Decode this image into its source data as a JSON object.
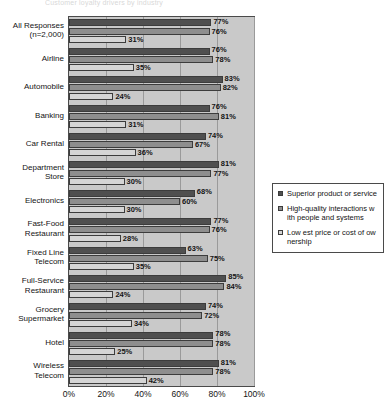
{
  "title_strip": "Customer loyalty drivers by industry",
  "chart_data": {
    "type": "bar",
    "orientation": "horizontal",
    "title": "",
    "xlabel": "",
    "ylabel": "",
    "xlim": [
      0,
      100
    ],
    "xticks": [
      "0%",
      "20%",
      "40%",
      "60%",
      "80%",
      "100%"
    ],
    "xtick_values": [
      0,
      20,
      40,
      60,
      80,
      100
    ],
    "grid": true,
    "legend_position": "right",
    "categories": [
      "All Responses\n(n=2,000)",
      "Airline",
      "Automobile",
      "Banking",
      "Car Rental",
      "Department\nStore",
      "Electronics",
      "Fast-Food\nRestaurant",
      "Fixed Line\nTelecom",
      "Full-Service\nRestaurant",
      "Grocery\nSupermarket",
      "Hotel",
      "Wireless\nTelecom"
    ],
    "series": [
      {
        "name": "Superior product or service",
        "color": "#4f4f4f",
        "values": [
          77,
          76,
          83,
          76,
          74,
          81,
          68,
          77,
          63,
          85,
          74,
          78,
          81
        ],
        "labels": [
          "77%",
          "76%",
          "83%",
          "76%",
          "74%",
          "81%",
          "68%",
          "77%",
          "63%",
          "85%",
          "74%",
          "78%",
          "81%"
        ]
      },
      {
        "name": "High-quality interactions with people and systems",
        "color": "#8e8e8e",
        "values": [
          76,
          78,
          82,
          81,
          67,
          77,
          60,
          76,
          75,
          84,
          72,
          78,
          78
        ],
        "labels": [
          "76%",
          "78%",
          "82%",
          "81%",
          "67%",
          "77%",
          "60%",
          "76%",
          "75%",
          "84%",
          "72%",
          "78%",
          "78%"
        ]
      },
      {
        "name": "Lowest price or cost of ownership",
        "color": "#d5d5d5",
        "values": [
          31,
          35,
          24,
          31,
          36,
          30,
          30,
          28,
          35,
          24,
          34,
          25,
          42
        ],
        "labels": [
          "31%",
          "35%",
          "24%",
          "31%",
          "36%",
          "30%",
          "30%",
          "28%",
          "35%",
          "24%",
          "34%",
          "25%",
          "42%"
        ]
      }
    ]
  },
  "legend": {
    "items": [
      {
        "label": "Superior product or service",
        "color": "#4f4f4f"
      },
      {
        "label": "High-quality interactions w ith people and systems",
        "color": "#8e8e8e"
      },
      {
        "label": "Low est price or cost of ow nership",
        "color": "#d5d5d5"
      }
    ]
  }
}
